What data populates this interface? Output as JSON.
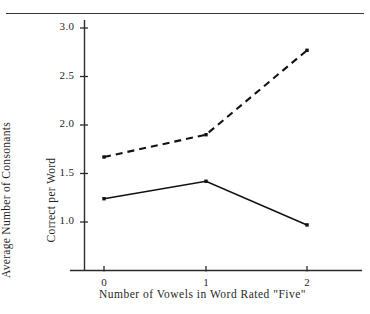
{
  "chart_data": {
    "type": "line",
    "title": "",
    "xlabel": "Number of Vowels in Word Rated \"Five\"",
    "ylabel_line1": "Average Number of Consonants",
    "ylabel_line2": "Correct per Word",
    "x": [
      0,
      1,
      2
    ],
    "xtick_labels": [
      "0",
      "1",
      "2"
    ],
    "ytick_labels": [
      "3.0",
      "2.5",
      "2.0",
      "1.5",
      "1.0"
    ],
    "ytick_values": [
      3.0,
      2.5,
      2.0,
      1.5,
      1.0
    ],
    "ylim": [
      0.62,
      3.1
    ],
    "xlim": [
      -0.38,
      2.38
    ],
    "grid": false,
    "legend": "none",
    "series": [
      {
        "name": "dashed-series",
        "style": "dashed",
        "color": "#111111",
        "marker": "square",
        "values": [
          1.67,
          1.9,
          2.77
        ]
      },
      {
        "name": "solid-series",
        "style": "solid",
        "color": "#111111",
        "marker": "square",
        "values": [
          1.24,
          1.42,
          0.97
        ]
      }
    ]
  },
  "figure": {
    "top_rule": "horizontal-rule"
  }
}
